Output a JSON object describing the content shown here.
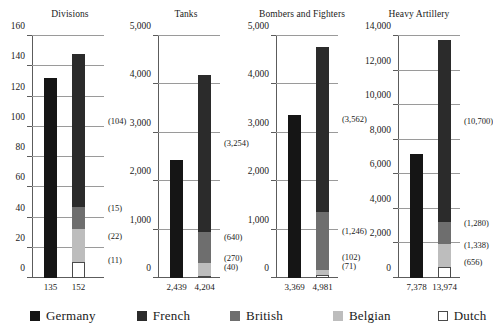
{
  "chart_data": {
    "type": "bar",
    "title": "",
    "subtitle": "",
    "layout": "four stacked-bar panels, German vs Allied comparison",
    "grid": true,
    "legend_position": "bottom",
    "series_names": [
      "Germany",
      "French",
      "British",
      "Belgian",
      "Dutch"
    ],
    "series_colors": {
      "Germany": "#151515",
      "French": "#2b2b2b",
      "British": "#6e6e6e",
      "Belgian": "#bdbdbd",
      "Dutch": "#ffffff"
    },
    "panels": [
      {
        "title": "Divisions",
        "ylim": [
          0,
          160
        ],
        "yticks": [
          0,
          20,
          40,
          60,
          80,
          100,
          120,
          140,
          160
        ],
        "ytick_labels": [
          "0",
          "20",
          "40",
          "60",
          "80",
          "100",
          "120",
          "140",
          "160"
        ],
        "german_total": 135,
        "german_total_label": "135",
        "german_bar_value": 132,
        "allied_total": 152,
        "allied_total_label": "152",
        "allied_bar_value": 148,
        "segments": [
          {
            "name": "Dutch",
            "value": 11,
            "label": "(11)"
          },
          {
            "name": "Belgian",
            "value": 22,
            "label": "(22)"
          },
          {
            "name": "British",
            "value": 15,
            "label": "(15)"
          },
          {
            "name": "French",
            "value": 104,
            "label": "(104)"
          }
        ]
      },
      {
        "title": "Tanks",
        "ylim": [
          0,
          5000
        ],
        "yticks": [
          0,
          1000,
          2000,
          3000,
          4000,
          5000
        ],
        "ytick_labels": [
          "0",
          "1,000",
          "2,000",
          "3,000",
          "4,000",
          "5,000"
        ],
        "german_total": 2439,
        "german_total_label": "2,439",
        "german_bar_value": 2439,
        "allied_total": 4204,
        "allied_total_label": "4,204",
        "allied_bar_value": 4204,
        "segments": [
          {
            "name": "Dutch",
            "value": 40,
            "label": "(40)"
          },
          {
            "name": "Belgian",
            "value": 270,
            "label": "(270)"
          },
          {
            "name": "British",
            "value": 640,
            "label": "(640)"
          },
          {
            "name": "French",
            "value": 3254,
            "label": "(3,254)"
          }
        ]
      },
      {
        "title": "Bombers and Fighters",
        "ylim": [
          0,
          5000
        ],
        "yticks": [
          0,
          1000,
          2000,
          3000,
          4000,
          5000
        ],
        "ytick_labels": [
          "0",
          "1,000",
          "2,000",
          "3,000",
          "4,000",
          "5,000"
        ],
        "german_total": 3369,
        "german_total_label": "3,369",
        "german_bar_value": 3369,
        "allied_total": 4981,
        "allied_total_label": "4,981",
        "allied_bar_value": 4781,
        "segments": [
          {
            "name": "Dutch",
            "value": 71,
            "label": "(71)"
          },
          {
            "name": "Belgian",
            "value": 102,
            "label": "(102)"
          },
          {
            "name": "British",
            "value": 1246,
            "label": "(1,246)"
          },
          {
            "name": "French",
            "value": 3562,
            "label": "(3,562)"
          }
        ]
      },
      {
        "title": "Heavy Artillery",
        "ylim": [
          0,
          14000
        ],
        "yticks": [
          0,
          2000,
          4000,
          6000,
          8000,
          10000,
          12000,
          14000
        ],
        "ytick_labels": [
          "0",
          "2,000",
          "4,000",
          "6,000",
          "8,000",
          "10,000",
          "12,000",
          "14,000"
        ],
        "german_total": 7378,
        "german_total_label": "7,378",
        "german_bar_value": 7150,
        "allied_total": 13974,
        "allied_total_label": "13,974",
        "allied_bar_value": 13800,
        "segments": [
          {
            "name": "Dutch",
            "value": 656,
            "label": "(656)"
          },
          {
            "name": "Belgian",
            "value": 1338,
            "label": "(1,338)"
          },
          {
            "name": "British",
            "value": 1280,
            "label": "(1,280)"
          },
          {
            "name": "French",
            "value": 10700,
            "label": "(10,700)"
          }
        ]
      }
    ]
  },
  "legend": {
    "items": [
      {
        "label": "Germany",
        "color": "#151515"
      },
      {
        "label": "French",
        "color": "#2b2b2b"
      },
      {
        "label": "British",
        "color": "#6e6e6e"
      },
      {
        "label": "Belgian",
        "color": "#bdbdbd"
      },
      {
        "label": "Dutch",
        "color": "#ffffff"
      }
    ]
  }
}
